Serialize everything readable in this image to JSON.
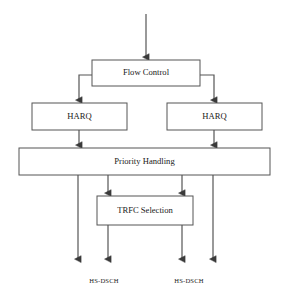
{
  "diagram": {
    "type": "flowchart",
    "stroke_color": "#555555",
    "text_color": "#1a1a1a",
    "background_color": "#ffffff",
    "boxes": [
      {
        "id": "flow-control",
        "label": "Flow Control",
        "x": 92,
        "y": 60,
        "w": 108,
        "h": 26
      },
      {
        "id": "harq-left",
        "label": "HARQ",
        "x": 32,
        "y": 103,
        "w": 95,
        "h": 27
      },
      {
        "id": "harq-right",
        "label": "HARQ",
        "x": 167,
        "y": 103,
        "w": 95,
        "h": 27
      },
      {
        "id": "priority-handling",
        "label": "Priority Handling",
        "x": 19,
        "y": 148,
        "w": 251,
        "h": 27
      },
      {
        "id": "trfc-selection",
        "label": "TRFC Selection",
        "x": 97,
        "y": 196,
        "w": 96,
        "h": 29
      }
    ],
    "output_labels": [
      {
        "id": "hs-dsch-left",
        "label": "HS-DSCH",
        "x": 104,
        "y": 281
      },
      {
        "id": "hs-dsch-right",
        "label": "HS-DSCH",
        "x": 189,
        "y": 281
      }
    ],
    "connections": [
      {
        "id": "input-to-flow-control",
        "from": "input",
        "to": "flow-control",
        "arrow": true
      },
      {
        "id": "flow-control-to-harq-left",
        "from": "flow-control",
        "to": "harq-left",
        "arrow": true
      },
      {
        "id": "flow-control-to-harq-right",
        "from": "flow-control",
        "to": "harq-right",
        "arrow": true
      },
      {
        "id": "harq-left-to-priority",
        "from": "harq-left",
        "to": "priority-handling",
        "arrow": true
      },
      {
        "id": "harq-right-to-priority",
        "from": "harq-right",
        "to": "priority-handling",
        "arrow": true
      },
      {
        "id": "priority-to-trfc-left",
        "from": "priority-handling",
        "to": "trfc-selection",
        "arrow": true
      },
      {
        "id": "priority-to-trfc-right",
        "from": "priority-handling",
        "to": "trfc-selection",
        "arrow": true
      },
      {
        "id": "priority-output-far-left",
        "from": "priority-handling",
        "to": "hs-dsch-left",
        "arrow": true
      },
      {
        "id": "priority-output-far-right",
        "from": "priority-handling",
        "to": "hs-dsch-right",
        "arrow": true
      },
      {
        "id": "trfc-output-left",
        "from": "trfc-selection",
        "to": "hs-dsch-left",
        "arrow": true
      },
      {
        "id": "trfc-output-right",
        "from": "trfc-selection",
        "to": "hs-dsch-right",
        "arrow": true
      }
    ]
  }
}
